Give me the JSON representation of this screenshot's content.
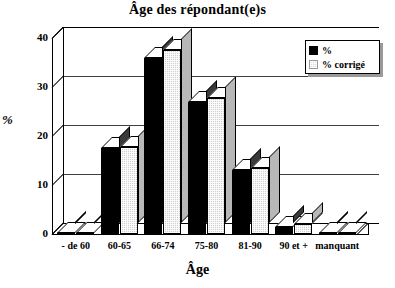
{
  "chart_data": {
    "type": "bar",
    "title": "Âge des répondant(e)s",
    "xlabel": "Âge",
    "ylabel": "%",
    "categories": [
      "- de 60",
      "60-65",
      "66-74",
      "75-80",
      "81-90",
      "90 et +",
      "manquant"
    ],
    "series": [
      {
        "name": "%",
        "values": [
          0.3,
          17.5,
          36.0,
          27.0,
          13.0,
          1.5,
          0.3
        ]
      },
      {
        "name": "% corrigé",
        "values": [
          0.3,
          17.8,
          37.5,
          27.8,
          13.5,
          2.0,
          0.3
        ]
      }
    ],
    "yticks": [
      0,
      10,
      20,
      30,
      40
    ],
    "ylim": [
      0,
      40
    ],
    "grid": true,
    "legend_position": "top-right",
    "style": "3d-column",
    "colors": {
      "series_1": "#000000",
      "series_2": "#d0d0d0",
      "axis": "#000000"
    }
  },
  "legend": {
    "items": [
      {
        "label": "%",
        "swatch": "black"
      },
      {
        "label": "% corrigé",
        "swatch": "hatched"
      }
    ]
  }
}
